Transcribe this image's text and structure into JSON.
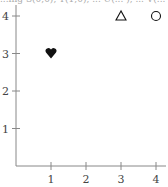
{
  "clipped_header_text": "...ing S(0,0), T(1,0), ... U(... ), ... V(... )",
  "chart_data": {
    "type": "scatter",
    "title": "",
    "xlabel": "",
    "ylabel": "",
    "xlim": [
      0,
      4
    ],
    "ylim": [
      0,
      4
    ],
    "x_ticks": [
      "1",
      "2",
      "3",
      "4"
    ],
    "y_ticks": [
      "1",
      "2",
      "3",
      "4"
    ],
    "grid": false,
    "legend": null,
    "points": [
      {
        "x": 1,
        "y": 3,
        "marker": "heart-filled",
        "glyph": "♥"
      },
      {
        "x": 3,
        "y": 4,
        "marker": "triangle-open",
        "glyph": "△"
      },
      {
        "x": 4,
        "y": 4,
        "marker": "circle-open",
        "glyph": "○"
      }
    ]
  },
  "colors": {
    "axis": "#888888",
    "marker": "#111111",
    "label": "#444444"
  }
}
